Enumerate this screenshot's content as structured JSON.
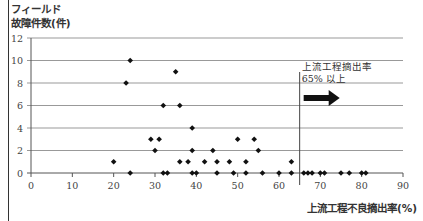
{
  "chart_data": {
    "type": "scatter",
    "title": "",
    "ylabel_line1": "フィールド",
    "ylabel_line2": "故障件数(件)",
    "xlabel": "上流工程不良摘出率(%)",
    "xlim": [
      0,
      90
    ],
    "ylim": [
      0,
      12
    ],
    "xticks": [
      0,
      10,
      20,
      30,
      40,
      50,
      60,
      70,
      80,
      90
    ],
    "yticks": [
      0,
      2,
      4,
      6,
      8,
      10,
      12
    ],
    "grid": "horizontal",
    "threshold_line": {
      "x": 65
    },
    "annotation": {
      "line1": "上流工程摘出率",
      "line2": "65% 以上",
      "arrow": "right"
    },
    "points": [
      [
        20,
        1
      ],
      [
        23,
        8
      ],
      [
        24,
        10
      ],
      [
        24,
        0
      ],
      [
        29,
        3
      ],
      [
        30,
        2
      ],
      [
        31,
        3
      ],
      [
        32,
        6
      ],
      [
        32,
        0
      ],
      [
        33,
        0
      ],
      [
        35,
        9
      ],
      [
        36,
        6
      ],
      [
        36,
        1
      ],
      [
        38,
        1
      ],
      [
        39,
        4
      ],
      [
        39,
        2
      ],
      [
        39,
        0
      ],
      [
        40,
        0
      ],
      [
        42,
        1
      ],
      [
        44,
        2
      ],
      [
        45,
        1
      ],
      [
        45,
        0
      ],
      [
        48,
        1
      ],
      [
        49,
        0
      ],
      [
        50,
        3
      ],
      [
        52,
        1
      ],
      [
        52,
        0
      ],
      [
        54,
        3
      ],
      [
        55,
        2
      ],
      [
        56,
        0
      ],
      [
        60,
        0
      ],
      [
        63,
        1
      ],
      [
        63,
        0
      ],
      [
        66,
        0
      ],
      [
        67,
        0
      ],
      [
        68,
        0
      ],
      [
        70,
        0
      ],
      [
        71,
        0
      ],
      [
        75,
        0
      ],
      [
        77,
        0
      ],
      [
        80,
        0
      ],
      [
        81,
        0
      ]
    ],
    "point_color": "#111111",
    "grid_color": "#999999"
  }
}
